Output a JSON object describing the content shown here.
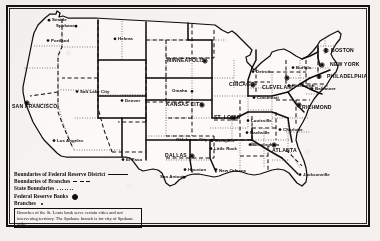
{
  "figure": {
    "frame_color": "#15130f",
    "paper_color": "#f5f4f1",
    "ink_color": "#100e0b"
  },
  "legend": {
    "rows": [
      {
        "label": "Boundaries of Federal Reserve District",
        "sample": "solid"
      },
      {
        "label": "Boundaries of Branches",
        "sample": "dashed"
      },
      {
        "label": "State Boundaries",
        "sample": "dotted"
      },
      {
        "label": "Federal Reserve Banks",
        "sample": "bank-sym"
      },
      {
        "label": "Branches",
        "sample": "branch-sym"
      }
    ],
    "note": "Branches of the St. Louis bank serve certain cities and not intervening territory. The Spokane branch is for city of Spokane only."
  },
  "reserve_banks": [
    {
      "name": "BOSTON",
      "x": 331,
      "y": 52,
      "mx": 326,
      "my": 50.5,
      "anchor": "start",
      "dx": 4
    },
    {
      "name": "NEW YORK",
      "x": 330,
      "y": 66,
      "mx": 322,
      "my": 65,
      "anchor": "start",
      "dx": 4
    },
    {
      "name": "PHILADELPHIA",
      "x": 327,
      "y": 78,
      "mx": 319,
      "my": 76.5,
      "anchor": "start",
      "dx": 4
    },
    {
      "name": "CLEVELAND",
      "x": 262,
      "y": 89,
      "mx": 287,
      "my": 78,
      "anchor": "start",
      "dx": 0
    },
    {
      "name": "RICHMOND",
      "x": 302,
      "y": 109,
      "mx": 299,
      "my": 105,
      "anchor": "start",
      "dx": 3
    },
    {
      "name": "ATLANTA",
      "x": 272,
      "y": 152,
      "mx": 274,
      "my": 145,
      "anchor": "start",
      "dx": 0
    },
    {
      "name": "CHICAGO",
      "x": 229,
      "y": 86,
      "mx": 253,
      "my": 85,
      "anchor": "start",
      "dx": 0
    },
    {
      "name": "ST. LOUIS",
      "x": 214,
      "y": 119,
      "mx": 233,
      "my": 118,
      "anchor": "start",
      "dx": 0
    },
    {
      "name": "MINNEAPOLIS",
      "x": 167,
      "y": 62,
      "mx": 205,
      "my": 61,
      "anchor": "start",
      "dx": 0
    },
    {
      "name": "KANSAS CITY",
      "x": 166,
      "y": 106,
      "mx": 202,
      "my": 105,
      "anchor": "start",
      "dx": 0
    },
    {
      "name": "DALLAS",
      "x": 165,
      "y": 157,
      "mx": 192,
      "my": 156,
      "anchor": "start",
      "dx": 0
    },
    {
      "name": "SAN FRANCISCO",
      "x": 12,
      "y": 108,
      "mx": 27,
      "my": 103,
      "anchor": "start",
      "dx": 0
    }
  ],
  "branches": [
    {
      "name": "Seattle",
      "x": 52,
      "y": 21,
      "mx": 49,
      "my": 20.2
    },
    {
      "name": "Spokane",
      "x": 56,
      "y": 27,
      "mx": 76,
      "my": 26.2
    },
    {
      "name": "Portland",
      "x": 51,
      "y": 42,
      "mx": 48,
      "my": 40.5
    },
    {
      "name": "Helena",
      "x": 118,
      "y": 40,
      "mx": 115,
      "my": 38.8
    },
    {
      "name": "Salt Lake City",
      "x": 80,
      "y": 93,
      "mx": 77,
      "my": 91.5
    },
    {
      "name": "Denver",
      "x": 125,
      "y": 102,
      "mx": 122,
      "my": 100.5
    },
    {
      "name": "Los Angeles",
      "x": 57,
      "y": 142,
      "mx": 54,
      "my": 140.6
    },
    {
      "name": "Omaha",
      "x": 172,
      "y": 92,
      "mx": 192,
      "my": 91.3
    },
    {
      "name": "Oklahoma City",
      "x": 176,
      "y": 141,
      "mx": 212,
      "my": 140.2
    },
    {
      "name": "Little Rock",
      "x": 214,
      "y": 150,
      "mx": 211,
      "my": 148.6
    },
    {
      "name": "Memphis",
      "x": 215,
      "y": 142,
      "mx": 212,
      "my": 140.6
    },
    {
      "name": "Louisville",
      "x": 251,
      "y": 122,
      "mx": 248,
      "my": 120.6
    },
    {
      "name": "Nashville",
      "x": 250,
      "y": 134,
      "mx": 247,
      "my": 132.6
    },
    {
      "name": "Birmingham",
      "x": 253,
      "y": 146,
      "mx": 250,
      "my": 144.6
    },
    {
      "name": "Jacksonville",
      "x": 303,
      "y": 176,
      "mx": 300,
      "my": 174.6
    },
    {
      "name": "New Orleans",
      "x": 219,
      "y": 172,
      "mx": 216,
      "my": 169.5
    },
    {
      "name": "Houston",
      "x": 188,
      "y": 171,
      "mx": 185,
      "my": 169.6
    },
    {
      "name": "San Antonio",
      "x": 160,
      "y": 178,
      "mx": 184,
      "my": 177.3
    },
    {
      "name": "El Paso",
      "x": 126,
      "y": 161,
      "mx": 123,
      "my": 159.6
    },
    {
      "name": "Detroit",
      "x": 256,
      "y": 73,
      "mx": 253,
      "my": 71.6
    },
    {
      "name": "Buffalo",
      "x": 296,
      "y": 69,
      "mx": 293,
      "my": 67.6
    },
    {
      "name": "Pittsburgh",
      "x": 292,
      "y": 87,
      "mx": 289,
      "my": 85.6
    },
    {
      "name": "Cincinnati",
      "x": 257,
      "y": 99,
      "mx": 254,
      "my": 97.6
    },
    {
      "name": "Baltimore",
      "x": 315,
      "y": 90,
      "mx": 312,
      "my": 88.6
    },
    {
      "name": "Charlotte",
      "x": 283,
      "y": 131,
      "mx": 280,
      "my": 129.6
    }
  ]
}
